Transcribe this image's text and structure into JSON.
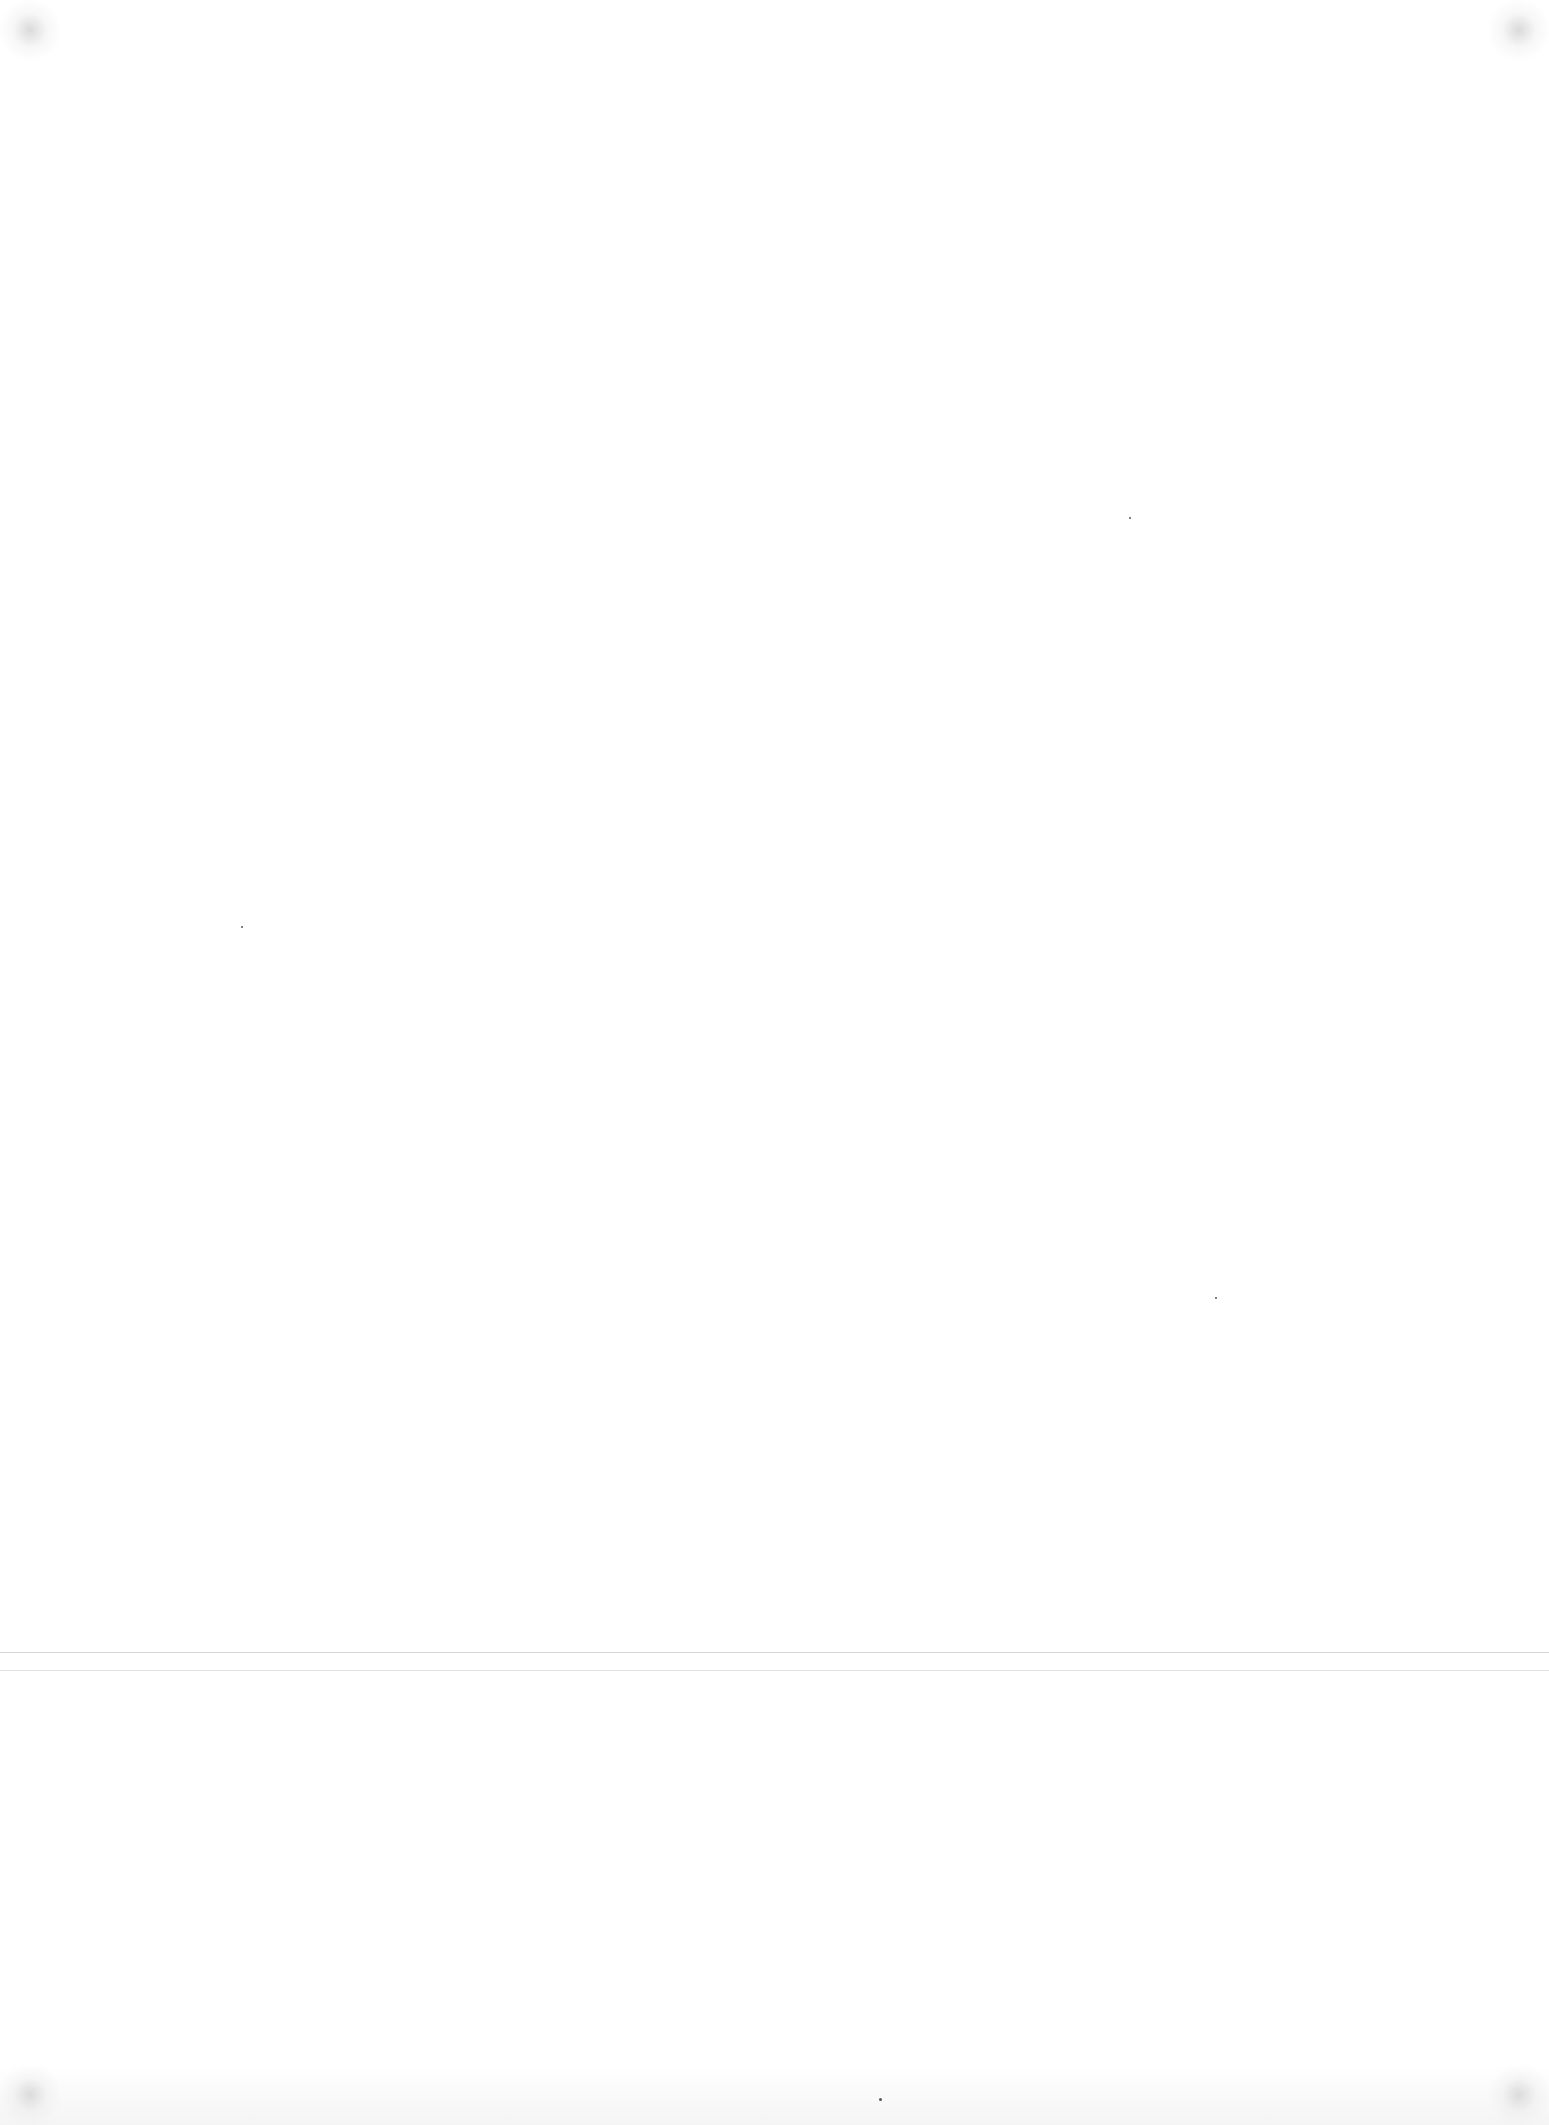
{
  "page": {
    "type": "blank scanned page",
    "background_color": "#ffffff",
    "crease_color": "#d8d8d8",
    "text": ""
  }
}
